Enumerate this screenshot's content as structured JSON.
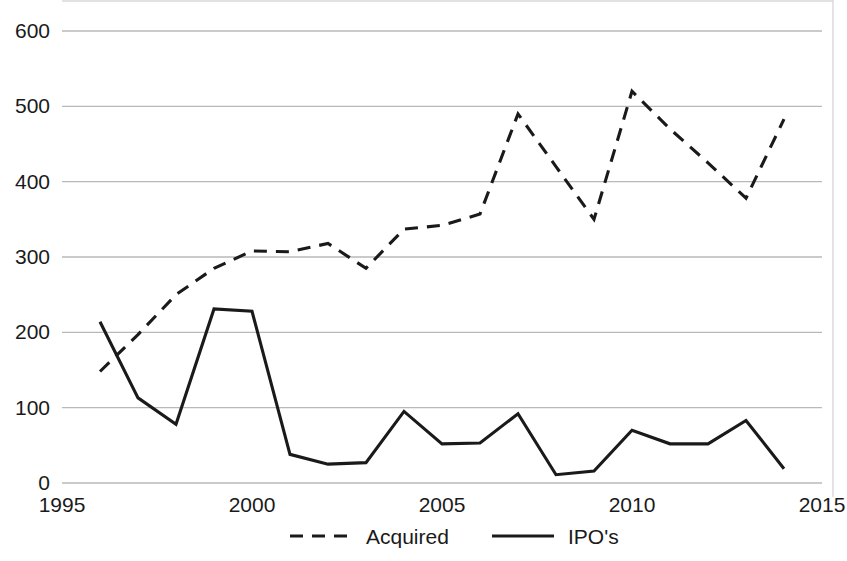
{
  "chart_data": {
    "type": "line",
    "title": "",
    "xlabel": "",
    "ylabel": "",
    "xlim": [
      1995,
      2015
    ],
    "ylim": [
      0,
      600
    ],
    "grid": true,
    "legend_position": "bottom",
    "xticks": [
      "1995",
      "2000",
      "2005",
      "2010",
      "2015"
    ],
    "xtick_values": [
      1995,
      2000,
      2005,
      2010,
      2015
    ],
    "yticks": [
      "0",
      "100",
      "200",
      "300",
      "400",
      "500",
      "600"
    ],
    "ytick_values": [
      0,
      100,
      200,
      300,
      400,
      500,
      600
    ],
    "x": [
      1996,
      1997,
      1998,
      1999,
      2000,
      2001,
      2002,
      2003,
      2004,
      2005,
      2006,
      2007,
      2008,
      2009,
      2010,
      2011,
      2012,
      2013,
      2014
    ],
    "series": [
      {
        "name": "Acquired",
        "style": "dashed",
        "color": "#1a1a1a",
        "values": [
          148,
          197,
          250,
          285,
          308,
          307,
          318,
          285,
          337,
          342,
          357,
          490,
          420,
          350,
          520,
          470,
          425,
          378,
          483
        ]
      },
      {
        "name": "IPO's",
        "style": "solid",
        "color": "#1a1a1a",
        "values": [
          214,
          113,
          78,
          231,
          228,
          38,
          25,
          27,
          95,
          52,
          53,
          92,
          11,
          16,
          70,
          52,
          52,
          83,
          19
        ]
      }
    ]
  },
  "legend": {
    "items": [
      {
        "label": "Acquired",
        "style": "dashed"
      },
      {
        "label": "IPO's",
        "style": "solid"
      }
    ]
  },
  "colors": {
    "ink": "#1a1a1a",
    "grid": "#b9b9b9",
    "frame": "#d8d8d8",
    "background": "#ffffff"
  }
}
